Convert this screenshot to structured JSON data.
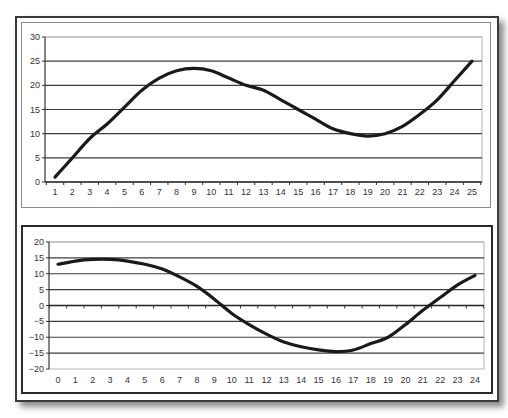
{
  "chart_data": [
    {
      "type": "line",
      "title": "",
      "xlabel": "",
      "ylabel": "",
      "x": [
        1,
        2,
        3,
        4,
        5,
        6,
        7,
        8,
        9,
        10,
        11,
        12,
        13,
        14,
        15,
        16,
        17,
        18,
        19,
        20,
        21,
        22,
        23,
        24,
        25
      ],
      "series": [
        {
          "name": "Series 1",
          "values": [
            1,
            5,
            9,
            12,
            15.5,
            19,
            21.5,
            23,
            23.5,
            23,
            21.5,
            20,
            19,
            17,
            15,
            13,
            11,
            10,
            9.5,
            10,
            11.5,
            14,
            17,
            21,
            25
          ]
        }
      ],
      "yticks": [
        0,
        5,
        10,
        15,
        20,
        25,
        30
      ],
      "ylim": [
        0,
        30
      ],
      "grid": true,
      "legend": "none",
      "line_color": "#1a1a1a"
    },
    {
      "type": "line",
      "title": "",
      "xlabel": "",
      "ylabel": "",
      "x": [
        0,
        1,
        2,
        3,
        4,
        5,
        6,
        7,
        8,
        9,
        10,
        11,
        12,
        13,
        14,
        15,
        16,
        17,
        18,
        19,
        20,
        21,
        22,
        23,
        24
      ],
      "series": [
        {
          "name": "Series 1",
          "values": [
            13,
            14,
            14.5,
            14.5,
            14,
            13,
            11.5,
            9,
            6,
            2,
            -2.5,
            -6,
            -9,
            -11.5,
            -13,
            -14,
            -14.5,
            -14,
            -12,
            -10,
            -6,
            -1.5,
            2.5,
            6.5,
            9.5
          ]
        }
      ],
      "yticks": [
        -20,
        -15,
        -10,
        -5,
        0,
        5,
        10,
        15,
        20
      ],
      "ylim": [
        -20,
        20
      ],
      "grid": true,
      "legend": "none",
      "line_color": "#1a1a1a"
    }
  ]
}
